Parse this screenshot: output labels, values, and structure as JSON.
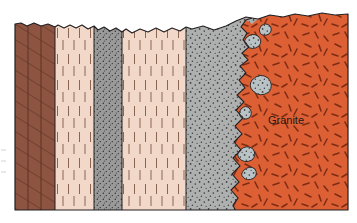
{
  "figure": {
    "kind": "geologic-cross-section",
    "title": "",
    "background_color": "#ffffff",
    "outline_color": "#231f20",
    "outline_width": 1.1,
    "frame": {
      "left": 15,
      "right": 348,
      "top_min": 12,
      "top_max": 32,
      "bottom": 210
    }
  },
  "labels": [
    {
      "name": "granite-label",
      "text": "Granite",
      "x": 286,
      "y": 120,
      "color": "#1a1a1a",
      "font_size": 11,
      "anchor": "middle"
    }
  ],
  "colors": {
    "shale_brown": "#8d5442",
    "shale_brown_dark": "#7a4434",
    "sandstone_pink": "#f2d8c8",
    "sandstone_pink_line": "#8a6552",
    "siltstone_gray": "#9a9a9a",
    "hornfels_gray": "#aeb0b0",
    "hornfels_stipple": "#3c3c3c",
    "granite_orange": "#dd6035",
    "granite_dash": "#7e2b14",
    "xenolith_gray": "#b9c2c4",
    "outline": "#231f20"
  },
  "units": [
    {
      "name": "shale-unit",
      "label": "",
      "x_left": 15,
      "x_right": 55,
      "fill": "#8d5442",
      "pattern": "diagonal-hatch",
      "pattern_color": "#5e3325",
      "pattern_spacing": 13,
      "internal_bed_lines": [
        28,
        41
      ],
      "top_profile": "flat-notched"
    },
    {
      "name": "sandstone-unit-1",
      "label": "",
      "x_left": 55,
      "x_right": 94,
      "fill": "#f2d8c8",
      "pattern": "vertical-dash",
      "pattern_color": "#8a6552",
      "top_profile": "scalloped"
    },
    {
      "name": "siltstone-unit",
      "label": "",
      "x_left": 94,
      "x_right": 122,
      "fill": "#9a9a9a",
      "pattern": "fine-stipple",
      "pattern_color": "#2f2f2f",
      "top_profile": "flat"
    },
    {
      "name": "sandstone-unit-2",
      "label": "",
      "x_left": 122,
      "x_right": 186,
      "fill": "#f2d8c8",
      "pattern": "vertical-dash",
      "pattern_color": "#8a6552",
      "top_profile": "scalloped"
    },
    {
      "name": "hornfels-aureole-unit",
      "label": "",
      "x_left": 186,
      "x_right": 300,
      "fill": "#aeb0b0",
      "pattern": "coarse-stipple",
      "pattern_color": "#3c3c3c",
      "top_profile": "rolling"
    },
    {
      "name": "granite-pluton-unit",
      "label": "Granite",
      "x_left": 235,
      "x_right": 348,
      "fill": "#dd6035",
      "pattern": "random-dashes",
      "pattern_color": "#7e2b14",
      "top_profile": "flat",
      "contact": "irregular-intrusive"
    }
  ],
  "xenoliths": [
    {
      "name": "xenolith-1",
      "cx": 253,
      "cy": 42,
      "rx": 9,
      "ry": 7
    },
    {
      "name": "xenolith-2",
      "cx": 261,
      "cy": 87,
      "rx": 10,
      "ry": 9
    },
    {
      "name": "xenolith-3",
      "cx": 245,
      "cy": 113,
      "rx": 5,
      "ry": 6
    },
    {
      "name": "xenolith-4",
      "cx": 246,
      "cy": 155,
      "rx": 7,
      "ry": 6
    },
    {
      "name": "xenolith-5",
      "cx": 249,
      "cy": 175,
      "rx": 6,
      "ry": 5
    },
    {
      "name": "xenolith-6",
      "cx": 265,
      "cy": 30,
      "rx": 5,
      "ry": 4
    }
  ],
  "margin_marks": {
    "name": "left-margin-marks",
    "visible": true,
    "color": "#9aa0a0",
    "items": [
      {
        "x": 3,
        "y": 150
      },
      {
        "x": 3,
        "y": 161
      },
      {
        "x": 3,
        "y": 172
      }
    ]
  }
}
